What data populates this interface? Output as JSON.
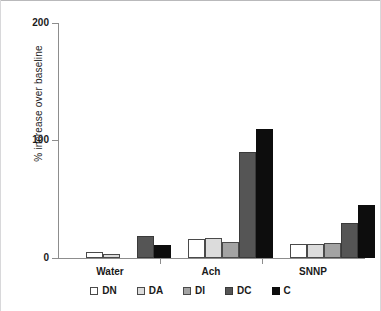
{
  "chart_data": {
    "type": "bar",
    "title": "",
    "xlabel": "",
    "ylabel": "% increase over baseline",
    "ylim": [
      0,
      200
    ],
    "yticks": [
      0,
      100,
      200
    ],
    "ytick_labels": [
      "0",
      "100",
      "200"
    ],
    "grid": false,
    "legend_position": "bottom",
    "categories": [
      "Water",
      "Ach",
      "SNNP"
    ],
    "series": [
      {
        "name": "DN",
        "color": "#ffffff",
        "values": [
          5,
          16,
          12
        ]
      },
      {
        "name": "DA",
        "color": "#dcdcdc",
        "values": [
          3,
          17,
          12
        ]
      },
      {
        "name": "DI",
        "color": "#a3a3a3",
        "values": [
          0,
          14,
          13
        ]
      },
      {
        "name": "DC",
        "color": "#555555",
        "values": [
          19,
          90,
          30
        ]
      },
      {
        "name": "C",
        "color": "#0d0d0d",
        "values": [
          11,
          110,
          45
        ]
      }
    ]
  },
  "axis": {
    "y_title": "% increase over baseline",
    "y_labels": {
      "top": "200",
      "mid": "100",
      "zero": "0"
    }
  },
  "categories": {
    "c0": "Water",
    "c1": "Ach",
    "c2": "SNNP"
  },
  "legend": {
    "items": [
      {
        "label": "DN"
      },
      {
        "label": "DA"
      },
      {
        "label": "DI"
      },
      {
        "label": "DC"
      },
      {
        "label": "C"
      }
    ]
  }
}
